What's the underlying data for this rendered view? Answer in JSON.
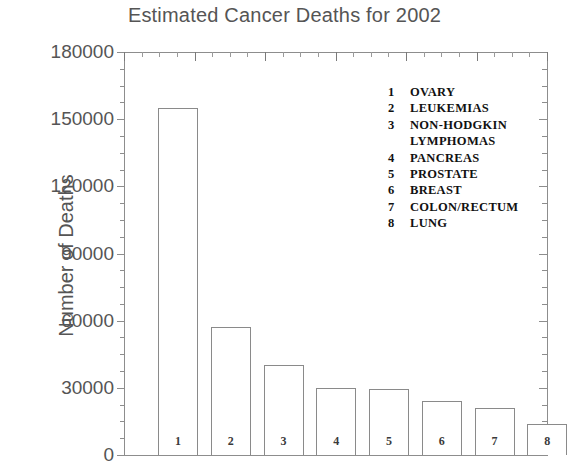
{
  "chart_data": {
    "type": "bar",
    "title": "Estimated Cancer Deaths for 2002",
    "xlabel": "",
    "ylabel": "Number of Deaths",
    "categories": [
      "1",
      "2",
      "3",
      "4",
      "5",
      "6",
      "7",
      "8"
    ],
    "values": [
      155000,
      57000,
      40000,
      30000,
      29500,
      24000,
      21000,
      14000
    ],
    "ylim": [
      0,
      180000
    ],
    "ytick_labels": [
      "180000",
      "150000",
      "120000",
      "90000",
      "60000",
      "30000",
      "0"
    ],
    "ytick_values": [
      180000,
      150000,
      120000,
      90000,
      60000,
      30000,
      0
    ],
    "minor_tick_step": 7500,
    "grid": false,
    "legend_position": "inside-upper-right",
    "legend": [
      {
        "key": "1",
        "label": "OVARY"
      },
      {
        "key": "2",
        "label": "LEUKEMIAS"
      },
      {
        "key": "3",
        "label": "NON-HODGKIN",
        "label2": "LYMPHOMAS"
      },
      {
        "key": "4",
        "label": "PANCREAS"
      },
      {
        "key": "5",
        "label": "PROSTATE"
      },
      {
        "key": "6",
        "label": "BREAST"
      },
      {
        "key": "7",
        "label": "COLON/RECTUM"
      },
      {
        "key": "8",
        "label": "LUNG"
      }
    ],
    "colors": {
      "background": "#ffffff",
      "bar_fill": "#ffffff",
      "bar_edge": "#8a8a8a",
      "axis": "#8d8d8d",
      "title_text": "#555555",
      "legend_text": "#111111"
    }
  }
}
